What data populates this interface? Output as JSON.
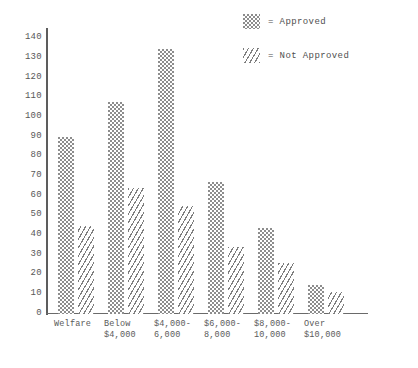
{
  "chart_data": {
    "type": "bar",
    "title": "",
    "subtitle": "",
    "xlabel": "",
    "ylabel": "",
    "ylim": [
      0,
      145
    ],
    "yticks": [
      0,
      10,
      20,
      30,
      40,
      50,
      60,
      70,
      80,
      90,
      100,
      110,
      120,
      130,
      140
    ],
    "ytick_labels": [
      "0",
      "10",
      "20",
      "30",
      "40",
      "50",
      "60",
      "70",
      "80",
      "90",
      "100",
      "110",
      "120",
      "130",
      "140"
    ],
    "grid": false,
    "legend_position": "top-right",
    "categories": [
      "Welfare",
      "Below\n$4,000",
      "$4,000-\n6,000",
      "$6,000-\n8,000",
      "$8,000-\n10,000",
      "Over\n$10,000"
    ],
    "series": [
      {
        "name": "Approved",
        "pattern": "dotted-checker",
        "color": "#8d8d8d",
        "values": [
          90,
          108,
          135,
          67,
          44,
          15
        ]
      },
      {
        "name": "Not Approved",
        "pattern": "diagonal-hatch",
        "color": "#7e7e7e",
        "values": [
          45,
          64,
          55,
          34,
          26,
          11
        ]
      }
    ],
    "annotations": []
  },
  "legend": {
    "items": [
      {
        "marker": "approved-swatch",
        "label": "= Approved"
      },
      {
        "marker": "not-approved-swatch",
        "label": "= Not Approved"
      }
    ]
  }
}
